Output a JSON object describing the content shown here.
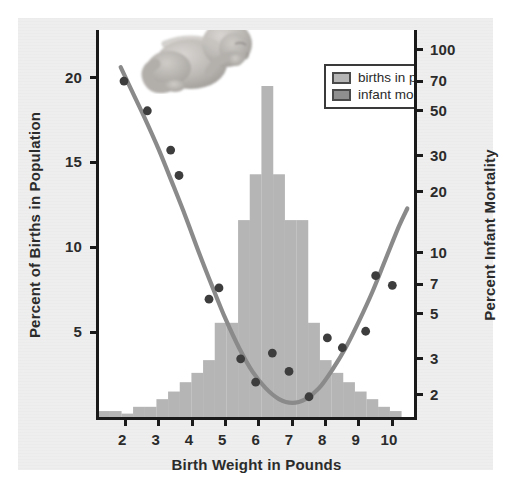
{
  "figure": {
    "background_color": "#eeeeee",
    "plot_background": "#ffffff",
    "axis_color": "#1a1a1a",
    "histogram_color": "#b5b5b5",
    "curve_color": "#8a8a8a",
    "dot_color": "#3d3d3d",
    "legend_swatch_births": "#b5b5b5",
    "legend_swatch_mortality": "#8f8f8f"
  },
  "legend": {
    "position": "top-right",
    "items": [
      {
        "label": "births in population",
        "color": "#b5b5b5",
        "name": "births-in-population"
      },
      {
        "label": "infant mortality",
        "color": "#8f8f8f",
        "name": "infant-mortality"
      }
    ]
  },
  "decoration": {
    "infant_photo_alt": "grayscale photograph of a newborn infant curled up"
  },
  "chart_data": {
    "type": "bar",
    "title": "",
    "subtitle": "",
    "xlabel": "Birth Weight in Pounds",
    "ylabel": "Percent of Births in Population",
    "y2label": "Percent Infant Mortality",
    "grid": false,
    "legend_position": "top-right",
    "xlim": [
      1.3,
      10.75
    ],
    "xticks": [
      2,
      3,
      4,
      5,
      6,
      7,
      8,
      9,
      10
    ],
    "xtick_labels": [
      "2",
      "3",
      "4",
      "5",
      "6",
      "7",
      "8",
      "9",
      "10"
    ],
    "ylim": [
      0,
      22.8
    ],
    "yticks": [
      5,
      10,
      15,
      20
    ],
    "ytick_labels": [
      "5",
      "10",
      "15",
      "20"
    ],
    "y2_scale": "log",
    "y2lim": [
      1.55,
      125
    ],
    "y2ticks": [
      2,
      3,
      5,
      7,
      10,
      20,
      30,
      50,
      70,
      100
    ],
    "y2tick_labels": [
      "2",
      "3",
      "5",
      "7",
      "10",
      "20",
      "30",
      "50",
      "70",
      "100"
    ],
    "series": [
      {
        "name": "births in population",
        "type": "bar",
        "axis": "left",
        "color": "#b5b5b5",
        "bin_width": 0.355,
        "bins": [
          {
            "x": 1.45,
            "value": 0.35
          },
          {
            "x": 1.8,
            "value": 0.35
          },
          {
            "x": 2.15,
            "value": 0.2
          },
          {
            "x": 2.5,
            "value": 0.6
          },
          {
            "x": 2.85,
            "value": 0.6
          },
          {
            "x": 3.2,
            "value": 1.05
          },
          {
            "x": 3.55,
            "value": 1.5
          },
          {
            "x": 3.9,
            "value": 2.05
          },
          {
            "x": 4.25,
            "value": 2.6
          },
          {
            "x": 4.6,
            "value": 3.35
          },
          {
            "x": 4.95,
            "value": 5.55
          },
          {
            "x": 5.3,
            "value": 5.55
          },
          {
            "x": 5.65,
            "value": 11.6
          },
          {
            "x": 6.0,
            "value": 14.3
          },
          {
            "x": 6.35,
            "value": 19.5
          },
          {
            "x": 6.7,
            "value": 14.3
          },
          {
            "x": 7.05,
            "value": 11.6
          },
          {
            "x": 7.4,
            "value": 11.6
          },
          {
            "x": 7.75,
            "value": 5.55
          },
          {
            "x": 8.1,
            "value": 3.35
          },
          {
            "x": 8.45,
            "value": 2.6
          },
          {
            "x": 8.8,
            "value": 2.05
          },
          {
            "x": 9.15,
            "value": 1.5
          },
          {
            "x": 9.5,
            "value": 1.05
          },
          {
            "x": 9.85,
            "value": 0.6
          },
          {
            "x": 10.2,
            "value": 0.35
          }
        ]
      },
      {
        "name": "infant mortality",
        "type": "scatter",
        "axis": "right",
        "color": "#3d3d3d",
        "points": [
          {
            "x": 2.05,
            "y": 70
          },
          {
            "x": 2.75,
            "y": 50
          },
          {
            "x": 3.45,
            "y": 32
          },
          {
            "x": 3.7,
            "y": 24
          },
          {
            "x": 4.6,
            "y": 5.9
          },
          {
            "x": 4.9,
            "y": 6.7
          },
          {
            "x": 5.55,
            "y": 3.0
          },
          {
            "x": 6.0,
            "y": 2.3
          },
          {
            "x": 6.5,
            "y": 3.2
          },
          {
            "x": 7.0,
            "y": 2.6
          },
          {
            "x": 7.6,
            "y": 1.95
          },
          {
            "x": 8.15,
            "y": 3.8
          },
          {
            "x": 8.6,
            "y": 3.4
          },
          {
            "x": 9.3,
            "y": 4.1
          },
          {
            "x": 9.6,
            "y": 7.7
          },
          {
            "x": 10.1,
            "y": 6.9
          }
        ]
      },
      {
        "name": "infant mortality fitted curve",
        "type": "line",
        "axis": "right",
        "color": "#8a8a8a",
        "points": [
          {
            "x": 1.95,
            "y": 82
          },
          {
            "x": 2.3,
            "y": 62
          },
          {
            "x": 2.7,
            "y": 45
          },
          {
            "x": 3.1,
            "y": 32
          },
          {
            "x": 3.5,
            "y": 22
          },
          {
            "x": 3.9,
            "y": 15
          },
          {
            "x": 4.3,
            "y": 10.0
          },
          {
            "x": 4.7,
            "y": 6.8
          },
          {
            "x": 5.1,
            "y": 4.7
          },
          {
            "x": 5.5,
            "y": 3.4
          },
          {
            "x": 5.9,
            "y": 2.6
          },
          {
            "x": 6.3,
            "y": 2.15
          },
          {
            "x": 6.7,
            "y": 1.9
          },
          {
            "x": 7.1,
            "y": 1.82
          },
          {
            "x": 7.5,
            "y": 1.9
          },
          {
            "x": 7.9,
            "y": 2.15
          },
          {
            "x": 8.3,
            "y": 2.65
          },
          {
            "x": 8.7,
            "y": 3.4
          },
          {
            "x": 9.1,
            "y": 4.6
          },
          {
            "x": 9.5,
            "y": 6.4
          },
          {
            "x": 9.9,
            "y": 9.3
          },
          {
            "x": 10.3,
            "y": 13.5
          },
          {
            "x": 10.55,
            "y": 16.5
          }
        ]
      }
    ]
  }
}
